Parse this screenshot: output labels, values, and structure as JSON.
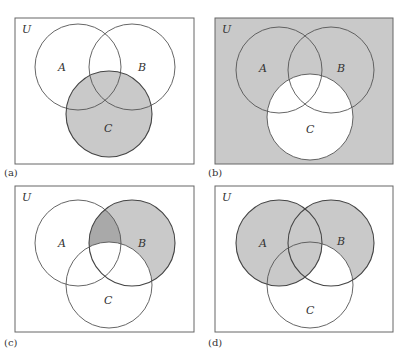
{
  "colors": {
    "shade": "#c9c9c9",
    "shade_dark": "#a9a9a9",
    "stroke": "#555555",
    "background": "#ffffff"
  },
  "panels": [
    {
      "id": "a",
      "caption": "(a)",
      "universe_label": "U",
      "set_labels": [
        "A",
        "B",
        "C"
      ],
      "shaded_region": "C"
    },
    {
      "id": "b",
      "caption": "(b)",
      "universe_label": "U",
      "set_labels": [
        "A",
        "B",
        "C"
      ],
      "shaded_region": "complement of C"
    },
    {
      "id": "c",
      "caption": "(c)",
      "universe_label": "U",
      "set_labels": [
        "A",
        "B",
        "C"
      ],
      "shaded_region": "B minus C, with A∩B minus C darker"
    },
    {
      "id": "d",
      "caption": "(d)",
      "universe_label": "U",
      "set_labels": [
        "A",
        "B",
        "C"
      ],
      "shaded_region": "A ∪ (B minus C)"
    }
  ]
}
